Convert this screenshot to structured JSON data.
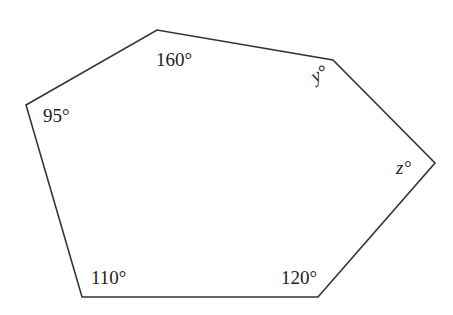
{
  "diagram": {
    "type": "hexagon",
    "stroke_color": "#333333",
    "vertices": [
      {
        "x": 26,
        "y": 105
      },
      {
        "x": 157,
        "y": 30
      },
      {
        "x": 333,
        "y": 60
      },
      {
        "x": 435,
        "y": 163
      },
      {
        "x": 318,
        "y": 297
      },
      {
        "x": 82,
        "y": 297
      }
    ],
    "angles": {
      "a160": "160°",
      "a95": "95°",
      "y": "y°",
      "z": "z°",
      "a110": "110°",
      "a120": "120°"
    }
  }
}
